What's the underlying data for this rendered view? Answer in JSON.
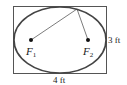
{
  "diagram": {
    "type": "ellipse-in-rectangle",
    "foci": [
      {
        "label": "F",
        "sub": "1"
      },
      {
        "label": "F",
        "sub": "2"
      }
    ],
    "height_label": "3 ft",
    "width_label": "4 ft",
    "colors": {
      "stroke": "#333333",
      "ellipse": "#444444",
      "point": "#111111"
    }
  }
}
